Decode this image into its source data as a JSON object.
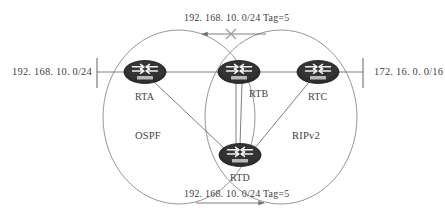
{
  "diagram": {
    "title_fragment_top": "",
    "caption_fragment_bottom": "",
    "zones": [
      {
        "id": "ospf",
        "label": "OSPF",
        "protocol": "OSPF"
      },
      {
        "id": "ripv2",
        "label": "RIPv2",
        "protocol": "RIPv2"
      }
    ],
    "networks": {
      "left": "192. 168. 10. 0/24",
      "right": "172. 16. 0. 0/16"
    },
    "routers": [
      {
        "id": "rta",
        "label": "RTA",
        "icon": "router-icon"
      },
      {
        "id": "rtb",
        "label": "RTB",
        "icon": "router-icon"
      },
      {
        "id": "rtc",
        "label": "RTC",
        "icon": "router-icon"
      },
      {
        "id": "rtd",
        "label": "RTD",
        "icon": "router-icon"
      }
    ],
    "route_annotations": [
      {
        "id": "top",
        "text": "192. 168. 10. 0/24  Tag=5",
        "direction": "left",
        "blocked": true,
        "marker": "x-block-icon"
      },
      {
        "id": "bottom",
        "text": "192. 168. 10. 0/24  Tag=5",
        "direction": "right",
        "blocked": false,
        "marker": "arrow-right-icon"
      }
    ],
    "colors": {
      "line": "#6f6f6f",
      "router_body": "#2e2e2e",
      "router_arrow": "#f2f2f2",
      "router_strip": "#b9b9b9",
      "text": "#43423f",
      "background": "#ffffff"
    }
  }
}
